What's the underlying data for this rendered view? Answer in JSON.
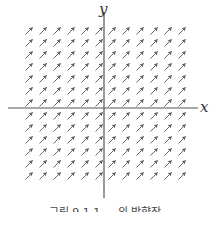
{
  "diagram": {
    "type": "direction_field",
    "axes": {
      "x_label": "x",
      "y_label": "y"
    },
    "arrow_slope": 1,
    "grid": {
      "columns": 12,
      "rows": 13,
      "cols_left_of_y_axis": 6,
      "cols_right_of_y_axis": 6,
      "rows_above_x_axis": 7,
      "rows_below_x_axis": 6
    },
    "colors": {
      "axis": "#555555",
      "arrow": "#666666",
      "background": "#ffffff"
    }
  },
  "caption": "그림 9.1.1 ... 의 방향장"
}
